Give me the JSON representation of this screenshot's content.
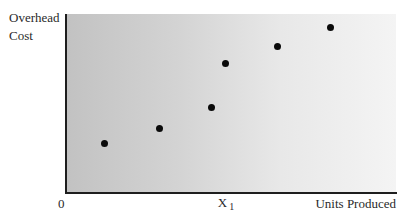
{
  "chart_data": {
    "type": "scatter",
    "title": "",
    "xlabel": "Units Produced",
    "ylabel": "Overhead Cost",
    "origin_label": "0",
    "x_annotations": [
      {
        "label": "X",
        "subscript": "1",
        "x": 48.5
      }
    ],
    "xlim": [
      0,
      100
    ],
    "ylim": [
      0,
      100
    ],
    "grid": false,
    "legend": null,
    "background": "horizontal gradient, grey (#c2c2c2) left to near-white (#f4f4f4) right",
    "points": [
      {
        "x": 11.8,
        "y": 27.4
      },
      {
        "x": 28.2,
        "y": 36.3
      },
      {
        "x": 44.2,
        "y": 47.5
      },
      {
        "x": 48.2,
        "y": 72.6
      },
      {
        "x": 64.2,
        "y": 82.1
      },
      {
        "x": 80.0,
        "y": 92.7
      }
    ],
    "point_color": "#0a0a0a"
  },
  "labels": {
    "y_axis": "Overhead\nCost",
    "x_axis": "Units Produced",
    "origin": "0",
    "x1_main": "X",
    "x1_sub": "1"
  }
}
